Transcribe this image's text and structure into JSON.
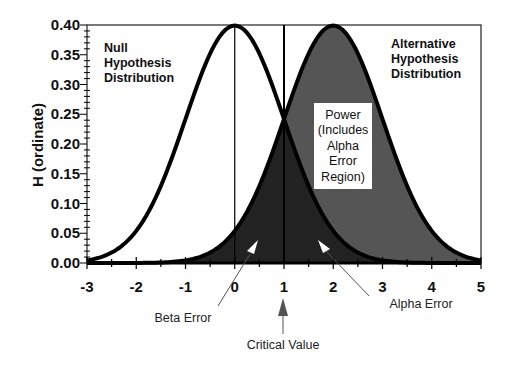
{
  "chart_data": {
    "type": "area",
    "title": "",
    "xlabel": "",
    "ylabel": "H (ordinate)",
    "xlim": [
      -3,
      5
    ],
    "ylim": [
      0,
      0.4
    ],
    "x_ticks": [
      "-3",
      "-2",
      "-1",
      "0",
      "1",
      "2",
      "3",
      "4",
      "5"
    ],
    "y_ticks": [
      "0.00",
      "0.05",
      "0.10",
      "0.15",
      "0.20",
      "0.25",
      "0.30",
      "0.35",
      "0.40"
    ],
    "grid": false,
    "series": [
      {
        "name": "Null Hypothesis Distribution",
        "kind": "normal",
        "mean": 0,
        "sd": 1,
        "peak": 0.399
      },
      {
        "name": "Alternative Hypothesis Distribution",
        "kind": "normal",
        "mean": 2,
        "sd": 1,
        "peak": 0.399
      }
    ],
    "critical_value": 1,
    "regions": [
      {
        "name": "Beta Error",
        "description": "Area under alternative distribution left of critical value",
        "color": "#222222"
      },
      {
        "name": "Alpha Error",
        "description": "Area under null distribution right of critical value",
        "color": "#222222"
      },
      {
        "name": "Power",
        "description": "Area under alternative distribution right of critical value",
        "color": "#555555"
      }
    ],
    "annotations": [
      {
        "text": "Null Hypothesis Distribution",
        "x": -2.4,
        "y": 0.35
      },
      {
        "text": "Alternative Hypothesis Distribution",
        "x": 3.2,
        "y": 0.35
      },
      {
        "text": "Power (Includes Alpha Error Region)",
        "x": 2.35,
        "y": 0.2
      },
      {
        "text": "Beta Error",
        "x": 0.5,
        "y": -0.09
      },
      {
        "text": "Alpha Error",
        "x": 3.6,
        "y": -0.07
      },
      {
        "text": "Critical Value",
        "x": 1,
        "y": -0.14
      }
    ]
  },
  "labels": {
    "ylabel": "H (ordinate)",
    "null_line1": "Null",
    "null_line2": "Hypothesis",
    "null_line3": "Distribution",
    "alt_line1": "Alternative",
    "alt_line2": "Hypothesis",
    "alt_line3": "Distribution",
    "power_line1": "Power",
    "power_line2": "(Includes",
    "power_line3": "Alpha",
    "power_line4": "Error",
    "power_line5": "Region)",
    "beta_error": "Beta Error",
    "alpha_error": "Alpha Error",
    "critical_value": "Critical Value"
  },
  "colors": {
    "dark_fill": "#222222",
    "power_fill": "#555555",
    "curve": "#000000",
    "background": "#ffffff"
  }
}
